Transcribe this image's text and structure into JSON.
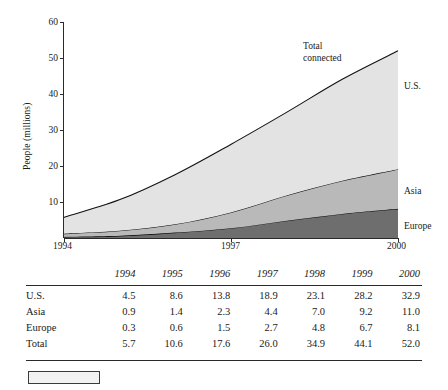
{
  "chart_data": {
    "type": "area",
    "stacked": true,
    "title": "",
    "xlabel": "",
    "ylabel": "People (millions)",
    "x": [
      1994,
      1995,
      1996,
      1997,
      1998,
      1999,
      2000
    ],
    "xtick_labels": [
      "1994",
      "1997",
      "2000"
    ],
    "xtick_values": [
      1994,
      1997,
      2000
    ],
    "xlim": [
      1994,
      2000
    ],
    "ylim": [
      0,
      60
    ],
    "ytick_labels": [
      "10",
      "20",
      "30",
      "40",
      "50",
      "60"
    ],
    "ytick_values": [
      10,
      20,
      30,
      40,
      50,
      60
    ],
    "grid": false,
    "legend_position": "right-of-plot",
    "stack_order_bottom_to_top": [
      "Europe",
      "Asia",
      "U.S."
    ],
    "series": [
      {
        "name": "Europe",
        "values": [
          0.3,
          0.6,
          1.5,
          2.7,
          4.8,
          6.7,
          8.1
        ],
        "color": "#6e6e6e"
      },
      {
        "name": "Asia",
        "values": [
          0.9,
          1.4,
          2.3,
          4.4,
          7.0,
          9.2,
          11.0
        ],
        "color": "#b9b9b9"
      },
      {
        "name": "U.S.",
        "values": [
          4.5,
          8.6,
          13.8,
          18.9,
          23.1,
          28.2,
          32.9
        ],
        "color": "#e3e3e3"
      }
    ],
    "totals": [
      5.7,
      10.6,
      17.6,
      26.0,
      34.9,
      44.1,
      52.0
    ],
    "annotations": [
      {
        "name": "total-connected",
        "line1": "Total",
        "line2": "connected"
      }
    ],
    "series_labels": [
      "U.S.",
      "Asia",
      "Europe"
    ]
  },
  "chart": {
    "y_axis_title": "People (millions)",
    "y_ticks": [
      "60",
      "50",
      "40",
      "30",
      "20",
      "10"
    ],
    "x_ticks": [
      "1994",
      "1997",
      "2000"
    ],
    "annotation": {
      "line1": "Total",
      "line2": "connected"
    },
    "labels": {
      "us": "U.S.",
      "asia": "Asia",
      "europe": "Europe"
    }
  },
  "table": {
    "corner_label": "",
    "columns": [
      "1994",
      "1995",
      "1996",
      "1997",
      "1998",
      "1999",
      "2000"
    ],
    "rows": [
      {
        "label": "U.S.",
        "values": [
          "4.5",
          "8.6",
          "13.8",
          "18.9",
          "23.1",
          "28.2",
          "32.9"
        ]
      },
      {
        "label": "Asia",
        "values": [
          "0.9",
          "1.4",
          "2.3",
          "4.4",
          "7.0",
          "9.2",
          "11.0"
        ]
      },
      {
        "label": "Europe",
        "values": [
          "0.3",
          "0.6",
          "1.5",
          "2.7",
          "4.8",
          "6.7",
          "8.1"
        ]
      },
      {
        "label": "Total",
        "values": [
          "5.7",
          "10.6",
          "17.6",
          "26.0",
          "34.9",
          "44.1",
          "52.0"
        ]
      }
    ]
  }
}
